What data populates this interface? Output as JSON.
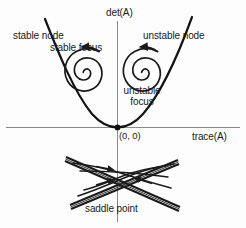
{
  "figure": {
    "background_color": "#fdfdfd",
    "stroke_color": "#1a1a1a",
    "axes": {
      "vertical_label": "det(A)",
      "horizontal_label": "trace(A)",
      "origin_label": "(0, 0)"
    },
    "regions": [
      {
        "key": "stable_node",
        "label": "stable node"
      },
      {
        "key": "stable_focus",
        "label": "stable focus"
      },
      {
        "key": "unstable_node",
        "label": "unstable node"
      },
      {
        "key": "unstable_focus",
        "label": "unstable\nfocus"
      },
      {
        "key": "saddle_point",
        "label": "saddle point"
      }
    ],
    "labels": {
      "stable_node": "stable node",
      "stable_focus": "stable focus",
      "unstable_node": "unstable node",
      "unstable_focus_line1": "unstable",
      "unstable_focus_line2": "focus",
      "saddle_point": "saddle point",
      "det_axis": "det(A)",
      "trace_axis": "trace(A)",
      "origin": "(0, 0)"
    }
  }
}
